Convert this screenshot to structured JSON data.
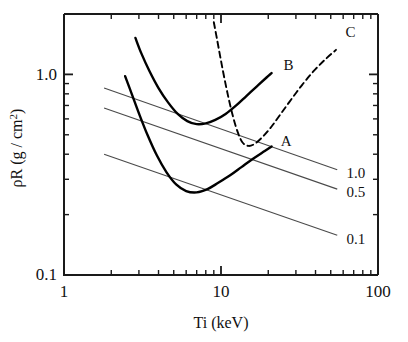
{
  "chart_data": {
    "type": "line",
    "title": "",
    "xlabel": "Ti (keV)",
    "ylabel": "ρR (g / cm²)",
    "ylabel_parts": {
      "main": "ρR (g / cm",
      "superscript": "2",
      "tail": ")"
    },
    "xscale": "log",
    "yscale": "log",
    "xlim": [
      1,
      100
    ],
    "ylim": [
      0.1,
      2.0
    ],
    "grid": false,
    "legend": "inline-curve-labels",
    "xticks_major": [
      "1",
      "10",
      "100"
    ],
    "xtick_major_values": [
      1,
      10,
      100
    ],
    "yticks_major": [
      "0.1",
      "1.0"
    ],
    "ytick_major_values": [
      0.1,
      1.0
    ],
    "series": [
      {
        "name": "A",
        "style": "solid",
        "label": "A",
        "label_x": 24,
        "label_y": 0.44,
        "points": [
          [
            2.45,
            0.98
          ],
          [
            2.7,
            0.8
          ],
          [
            3.0,
            0.64
          ],
          [
            3.4,
            0.5
          ],
          [
            3.9,
            0.395
          ],
          [
            4.5,
            0.325
          ],
          [
            5.2,
            0.282
          ],
          [
            6.0,
            0.262
          ],
          [
            7.0,
            0.258
          ],
          [
            8.2,
            0.268
          ],
          [
            9.6,
            0.288
          ],
          [
            11.5,
            0.315
          ],
          [
            13.5,
            0.345
          ],
          [
            16.0,
            0.38
          ],
          [
            19.0,
            0.415
          ],
          [
            21.0,
            0.437
          ]
        ]
      },
      {
        "name": "B",
        "style": "solid",
        "label": "B",
        "label_x": 25,
        "label_y": 1.05,
        "points": [
          [
            2.85,
            1.52
          ],
          [
            3.1,
            1.28
          ],
          [
            3.5,
            1.04
          ],
          [
            4.0,
            0.855
          ],
          [
            4.6,
            0.725
          ],
          [
            5.3,
            0.635
          ],
          [
            6.1,
            0.585
          ],
          [
            7.0,
            0.565
          ],
          [
            8.0,
            0.57
          ],
          [
            9.2,
            0.593
          ],
          [
            10.7,
            0.635
          ],
          [
            12.5,
            0.7
          ],
          [
            14.5,
            0.78
          ],
          [
            17.0,
            0.875
          ],
          [
            19.5,
            0.965
          ],
          [
            21.0,
            1.015
          ]
        ]
      },
      {
        "name": "C",
        "style": "dashed",
        "label": "C",
        "label_x": 62,
        "label_y": 1.53,
        "points": [
          [
            9.0,
            1.82
          ],
          [
            9.4,
            1.52
          ],
          [
            9.9,
            1.22
          ],
          [
            10.5,
            0.96
          ],
          [
            11.2,
            0.755
          ],
          [
            12.0,
            0.605
          ],
          [
            12.9,
            0.505
          ],
          [
            13.8,
            0.455
          ],
          [
            15.0,
            0.44
          ],
          [
            16.5,
            0.452
          ],
          [
            18.5,
            0.49
          ],
          [
            21.0,
            0.55
          ],
          [
            24.0,
            0.635
          ],
          [
            28.0,
            0.75
          ],
          [
            33.0,
            0.89
          ],
          [
            39.0,
            1.04
          ],
          [
            46.0,
            1.185
          ],
          [
            54.0,
            1.325
          ]
        ]
      }
    ],
    "straight_lines": [
      {
        "label": "1.0",
        "style": "thin-solid",
        "x0": 1.8,
        "y0": 0.855,
        "x1": 55.0,
        "y1": 0.335,
        "label_x": 63,
        "label_y": 0.322
      },
      {
        "label": "0.5",
        "style": "thin-solid",
        "x0": 1.8,
        "y0": 0.68,
        "x1": 55.0,
        "y1": 0.268,
        "label_x": 63,
        "label_y": 0.258
      },
      {
        "label": "0.1",
        "style": "thin-solid",
        "x0": 1.8,
        "y0": 0.4,
        "x1": 55.0,
        "y1": 0.158,
        "label_x": 63,
        "label_y": 0.152
      }
    ]
  },
  "axes": {
    "x_title": "Ti (keV)",
    "x_tick_1": "1",
    "x_tick_10": "10",
    "x_tick_100": "100",
    "y_tick_01": "0.1",
    "y_tick_10": "1.0",
    "y_title_main": "ρR (g / cm",
    "y_title_sup": "2",
    "y_title_tail": ")"
  },
  "curve_labels": {
    "a": "A",
    "b": "B",
    "c": "C"
  },
  "line_labels": {
    "one": "1.0",
    "half": "0.5",
    "tenth": "0.1"
  },
  "colors": {
    "axis": "#1a1a1a",
    "curve": "#000000",
    "thin_line": "#4a4a4a",
    "background": "#ffffff"
  }
}
